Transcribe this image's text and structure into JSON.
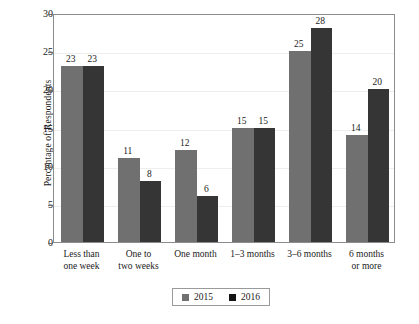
{
  "chart_data": {
    "type": "bar",
    "title": "",
    "subtitle": "",
    "xlabel": "",
    "ylabel": "Percentage of Respondents",
    "ylim": [
      0,
      30
    ],
    "yticks": [
      0,
      5,
      10,
      15,
      20,
      25,
      30
    ],
    "ytick_labels": [
      "0",
      "5",
      "10",
      "15",
      "20",
      "25",
      "30"
    ],
    "grid": true,
    "grid_axis": "y",
    "legend_position": "bottom-center",
    "categories": [
      "Less than\none week",
      "One to\ntwo weeks",
      "One month",
      "1–3 months",
      "3–6 months",
      "6 months\nor more"
    ],
    "series": [
      {
        "name": "2015",
        "color": "#707070",
        "values": [
          23,
          11,
          12,
          15,
          25,
          14
        ],
        "value_labels": [
          "23",
          "11",
          "12",
          "15",
          "25",
          "14"
        ]
      },
      {
        "name": "2016",
        "color": "#353535",
        "values": [
          23,
          8,
          6,
          15,
          28,
          20
        ],
        "value_labels": [
          "23",
          "8",
          "6",
          "15",
          "28",
          "20"
        ]
      }
    ]
  },
  "legend": {
    "items": [
      {
        "label": "2015",
        "color": "#707070"
      },
      {
        "label": "2016",
        "color": "#141414"
      }
    ]
  },
  "axes": {
    "y_title": "Percentage of Respondents"
  },
  "colors": {
    "series_2015": "#707070",
    "series_2016": "#353535",
    "frame": "#8c8c8c",
    "gridline": "#eeeeee",
    "text": "#1a1a1a",
    "background": "#ffffff"
  }
}
